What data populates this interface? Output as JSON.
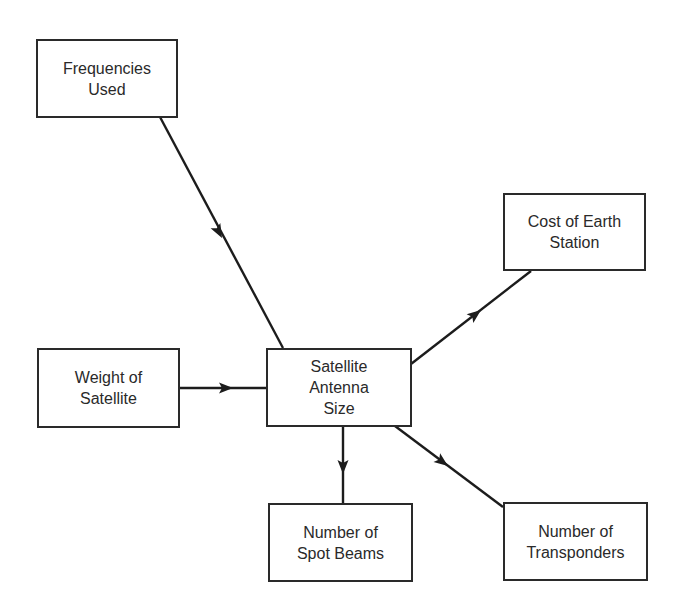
{
  "diagram": {
    "type": "cause-effect flow diagram",
    "central_node": "antenna",
    "nodes": {
      "frequencies": {
        "label": "Frequencies\nUsed"
      },
      "weight": {
        "label": "Weight of\nSatellite"
      },
      "antenna": {
        "label": "Satellite\nAntenna\nSize"
      },
      "cost": {
        "label": "Cost of Earth\nStation"
      },
      "spotbeams": {
        "label": "Number of\nSpot Beams"
      },
      "transponders": {
        "label": "Number of\nTransponders"
      }
    },
    "edges": [
      {
        "from": "frequencies",
        "to": "antenna"
      },
      {
        "from": "weight",
        "to": "antenna"
      },
      {
        "from": "antenna",
        "to": "cost"
      },
      {
        "from": "antenna",
        "to": "spotbeams"
      },
      {
        "from": "antenna",
        "to": "transponders"
      }
    ],
    "colors": {
      "stroke": "#1c1c1c",
      "text": "#2a2a2a",
      "background": "#ffffff"
    }
  }
}
